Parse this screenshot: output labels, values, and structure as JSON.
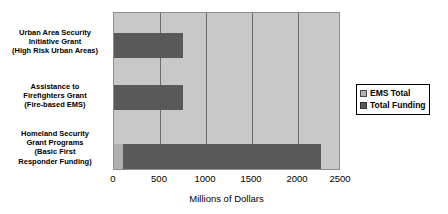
{
  "chart_data": {
    "type": "bar",
    "orientation": "horizontal",
    "title": "",
    "xlabel": "Millions of Dollars",
    "ylabel": "",
    "xlim": [
      0,
      2500
    ],
    "xticks": [
      0,
      500,
      1000,
      1500,
      2000,
      2500
    ],
    "xtick_labels": [
      "0",
      "500",
      "1000",
      "1500",
      "2000",
      "2500"
    ],
    "grid": true,
    "grid_axis": "x",
    "legend_position": "right",
    "categories": [
      "Urban Area Security\nInitiative Grant\n(High Risk Urban Areas)",
      "Assistance to\nFirefighters Grant\n(Fire-based EMS)",
      "Homeland Security\nGrant Programs\n(Basic First\nResponder Funding)"
    ],
    "series": [
      {
        "name": "EMS Total",
        "color": "#b0b0b0",
        "values": [
          0,
          0,
          100
        ]
      },
      {
        "name": "Total Funding",
        "color": "#595959",
        "values": [
          770,
          770,
          2200
        ]
      }
    ]
  },
  "legend": {
    "entries": [
      {
        "label": "EMS Total"
      },
      {
        "label": "Total Funding"
      }
    ]
  },
  "colors": {
    "plot_background": "#c8c8c8",
    "gridline": "#6b6b6b",
    "series_ems": "#b0b0b0",
    "series_total": "#595959",
    "text": "#000000"
  }
}
